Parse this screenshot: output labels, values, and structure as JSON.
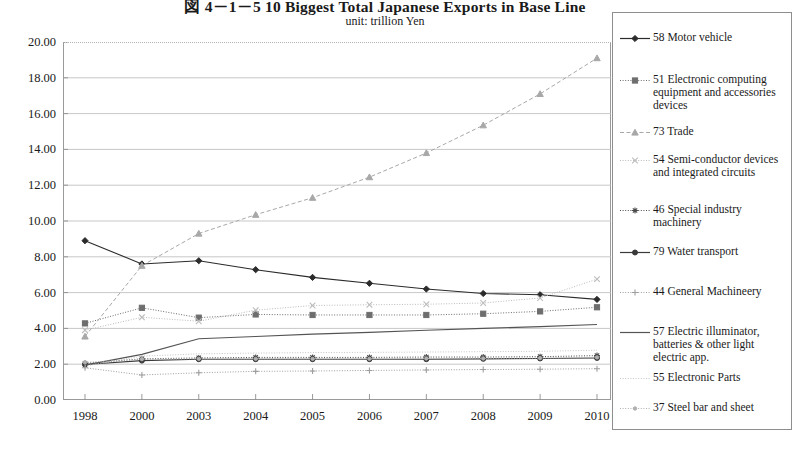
{
  "header": {
    "title": "図 4－1－5  10 Biggest Total Japanese Exports in Base Line",
    "subtitle": "unit: trillion  Yen"
  },
  "chart_data": {
    "type": "line",
    "title": "図 4－1－5  10 Biggest Total Japanese Exports in Base Line",
    "subtitle": "unit: trillion  Yen",
    "xlabel": "",
    "ylabel": "trillion Yen",
    "ylim": [
      0,
      20
    ],
    "ytick_step": 2,
    "grid": true,
    "legend_position": "right",
    "categories": [
      "1998",
      "2000",
      "2003",
      "2004",
      "2005",
      "2006",
      "2007",
      "2008",
      "2009",
      "2010"
    ],
    "ytick_labels": [
      "20.00",
      "18.00",
      "16.00",
      "14.00",
      "12.00",
      "10.00",
      "8.00",
      "6.00",
      "4.00",
      "2.00",
      "0.00"
    ],
    "series": [
      {
        "name": "58 Motor vehicle",
        "code": "58",
        "color": "#2b2b2b",
        "line_style": "solid",
        "marker": "diamond",
        "values": [
          8.9,
          7.6,
          7.78,
          7.28,
          6.85,
          6.52,
          6.2,
          5.95,
          5.88,
          5.62
        ]
      },
      {
        "name": "51 Electronic computing equipment and accessories devices",
        "code": "51",
        "color": "#6e6e6e",
        "line_style": "dotted",
        "marker": "square",
        "values": [
          4.28,
          5.15,
          4.6,
          4.78,
          4.75,
          4.75,
          4.75,
          4.82,
          4.95,
          5.18
        ]
      },
      {
        "name": "73 Trade",
        "code": "73",
        "color": "#a8a8a8",
        "line_style": "dashed",
        "marker": "triangle",
        "values": [
          3.55,
          7.5,
          9.3,
          10.35,
          11.3,
          12.45,
          13.8,
          15.35,
          17.1,
          19.1
        ]
      },
      {
        "name": "54 Semi-conductor devices and integrated circuits",
        "code": "54",
        "color": "#bcbcbc",
        "line_style": "dotted",
        "marker": "cross",
        "values": [
          3.9,
          4.62,
          4.4,
          5.02,
          5.28,
          5.32,
          5.35,
          5.42,
          5.7,
          6.75
        ]
      },
      {
        "name": "46 Special industry machinery",
        "code": "46",
        "color": "#4a4a4a",
        "line_style": "dotted",
        "marker": "asterisk",
        "values": [
          2.05,
          2.3,
          2.35,
          2.38,
          2.38,
          2.38,
          2.4,
          2.4,
          2.42,
          2.48
        ]
      },
      {
        "name": "79 Water transport",
        "code": "79",
        "color": "#3a3a3a",
        "line_style": "solid",
        "marker": "dot",
        "values": [
          1.98,
          2.2,
          2.28,
          2.28,
          2.28,
          2.28,
          2.28,
          2.3,
          2.32,
          2.35
        ]
      },
      {
        "name": "44 General Machineery",
        "code": "44",
        "color": "#9e9e9e",
        "line_style": "dotted",
        "marker": "plus",
        "values": [
          1.8,
          1.4,
          1.52,
          1.6,
          1.62,
          1.65,
          1.68,
          1.7,
          1.72,
          1.75
        ]
      },
      {
        "name": "57 Electric illuminator, batteries & other light electric app.",
        "code": "57",
        "color": "#545454",
        "line_style": "solid",
        "marker": "none",
        "values": [
          1.95,
          2.55,
          3.42,
          3.55,
          3.68,
          3.78,
          3.9,
          4.0,
          4.1,
          4.22
        ]
      },
      {
        "name": "55 Electronic Parts",
        "code": "55",
        "color": "#c4c4c4",
        "line_style": "dotted",
        "marker": "none",
        "values": [
          1.9,
          2.45,
          2.58,
          2.62,
          2.65,
          2.66,
          2.68,
          2.7,
          2.72,
          2.78
        ]
      },
      {
        "name": "37 Steel bar and sheet",
        "code": "37",
        "color": "#b0b0b0",
        "line_style": "dotted",
        "marker": "dot-small",
        "values": [
          2.1,
          2.28,
          2.3,
          2.3,
          2.3,
          2.3,
          2.32,
          2.32,
          2.34,
          2.38
        ]
      }
    ]
  },
  "legend": {
    "items": [
      {
        "label": "58 Motor vehicle"
      },
      {
        "label": "51 Electronic computing equipment and accessories devices"
      },
      {
        "label": "73 Trade"
      },
      {
        "label": "54 Semi-conductor devices and integrated circuits"
      },
      {
        "label": "46 Special industry machinery"
      },
      {
        "label": "79 Water transport"
      },
      {
        "label": "44 General Machineery"
      },
      {
        "label": "57 Electric illuminator, batteries & other light electric app."
      },
      {
        "label": "55 Electronic Parts"
      },
      {
        "label": "37 Steel bar and sheet"
      }
    ]
  }
}
